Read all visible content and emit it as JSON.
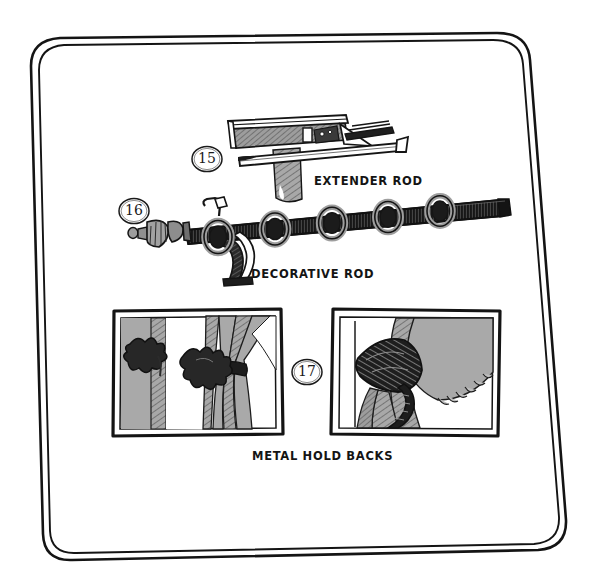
{
  "sheet": {
    "kind": "hand-drawn-sketch-page",
    "background_color": "#ffffff",
    "ink_color": "#141414",
    "border": {
      "name": "hand-drawn double rounded frame",
      "stroke_color": "#141414"
    }
  },
  "items": [
    {
      "number": "15",
      "label": "EXTENDER ROD",
      "subject": "wall-mounted telescoping extender curtain rod with bracket"
    },
    {
      "number": "16",
      "label": "DECORATIVE ROD",
      "subject": "decorative curtain rod with finial, scroll bracket and five rings",
      "ring_count": 5
    },
    {
      "number": "17",
      "label": "METAL HOLD BACKS",
      "subject": "two framed illustrations of curtain metal hold backs"
    }
  ],
  "palette": {
    "ink": "#141414",
    "dark_fill": "#1c1c1c",
    "mid_gray": "#9b9b9b",
    "light_gray": "#b4b4b4",
    "paper": "#ffffff"
  },
  "frames": [
    {
      "name": "left-holdback-frame",
      "caption_group": "METAL HOLD BACKS"
    },
    {
      "name": "right-holdback-frame",
      "caption_group": "METAL HOLD BACKS"
    }
  ]
}
